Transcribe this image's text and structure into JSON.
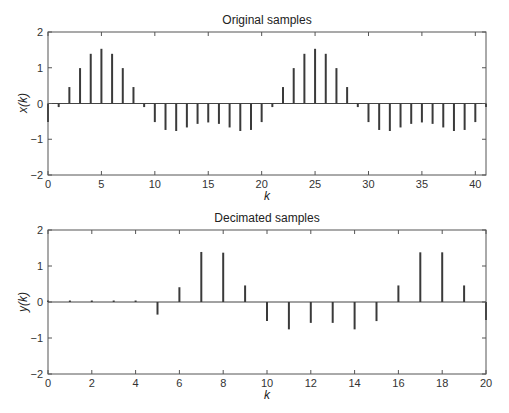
{
  "chart_data": [
    {
      "type": "stem",
      "title": "Original samples",
      "xlabel": "k",
      "ylabel": "x(k)",
      "xlim": [
        0,
        41
      ],
      "ylim": [
        -2,
        2
      ],
      "xticks": [
        0,
        5,
        10,
        15,
        20,
        25,
        30,
        35,
        40
      ],
      "yticks": [
        -2,
        -1,
        0,
        1,
        2
      ],
      "grid": false,
      "x": [
        0,
        1,
        2,
        3,
        4,
        5,
        6,
        7,
        8,
        9,
        10,
        11,
        12,
        13,
        14,
        15,
        16,
        17,
        18,
        19,
        20,
        21,
        22,
        23,
        24,
        25,
        26,
        27,
        28,
        29,
        30,
        31,
        32,
        33,
        34,
        35,
        36,
        37,
        38,
        39,
        40,
        41
      ],
      "values": [
        -0.52,
        -0.1,
        0.46,
        0.99,
        1.39,
        1.53,
        1.39,
        0.99,
        0.46,
        -0.1,
        -0.52,
        -0.74,
        -0.77,
        -0.67,
        -0.57,
        -0.53,
        -0.57,
        -0.67,
        -0.77,
        -0.74,
        -0.52,
        -0.1,
        0.46,
        0.99,
        1.39,
        1.53,
        1.39,
        0.99,
        0.46,
        -0.1,
        -0.52,
        -0.74,
        -0.77,
        -0.67,
        -0.57,
        -0.53,
        -0.57,
        -0.67,
        -0.77,
        -0.74,
        -0.52,
        -0.1
      ]
    },
    {
      "type": "stem",
      "title": "Decimated samples",
      "xlabel": "k",
      "ylabel": "y(k)",
      "xlim": [
        0,
        20
      ],
      "ylim": [
        -2,
        2
      ],
      "xticks": [
        0,
        2,
        4,
        6,
        8,
        10,
        12,
        14,
        16,
        18,
        20
      ],
      "yticks": [
        -2,
        -1,
        0,
        1,
        2
      ],
      "grid": false,
      "x": [
        0,
        1,
        2,
        3,
        4,
        5,
        6,
        7,
        8,
        9,
        10,
        11,
        12,
        13,
        14,
        15,
        16,
        17,
        18,
        19,
        20
      ],
      "values": [
        0,
        0.01,
        0.01,
        0.01,
        0.03,
        -0.35,
        0.41,
        1.39,
        1.37,
        0.46,
        -0.53,
        -0.76,
        -0.58,
        -0.58,
        -0.76,
        -0.53,
        0.46,
        1.38,
        1.38,
        0.46,
        -0.5
      ]
    }
  ],
  "colors": {
    "stem": "#3a3a3a",
    "axes": "#555555",
    "baseline": "#444444"
  }
}
